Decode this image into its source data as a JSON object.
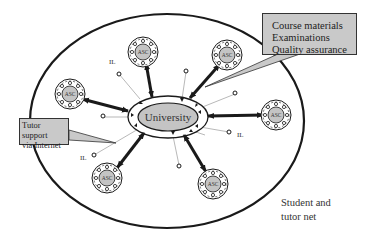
{
  "diagram": {
    "center": {
      "label": "University"
    },
    "satellite_label": "ASC",
    "satellites": [
      {
        "id": "asc-top-left",
        "label": "ASC"
      },
      {
        "id": "asc-top",
        "label": "ASC"
      },
      {
        "id": "asc-top-right",
        "label": "ASC"
      },
      {
        "id": "asc-right",
        "label": "ASC"
      },
      {
        "id": "asc-bottom-right",
        "label": "ASC"
      },
      {
        "id": "asc-bottom-left",
        "label": "ASC"
      }
    ],
    "independent_learner_label": "IL",
    "il_labels": [
      "IL",
      "IL",
      "IL",
      "IL"
    ],
    "callouts": {
      "top_right": {
        "lines": [
          "Course materials",
          "Examinations",
          "Quality assurance"
        ]
      },
      "left": {
        "lines": [
          "Tutor support",
          "via Internet"
        ]
      }
    },
    "net_label": {
      "lines": [
        "Student and",
        "tutor net"
      ]
    },
    "colors": {
      "node_fill": "#c4c4c4",
      "callout_fill": "#c9c9c9",
      "stroke": "#1a1a1a"
    }
  }
}
